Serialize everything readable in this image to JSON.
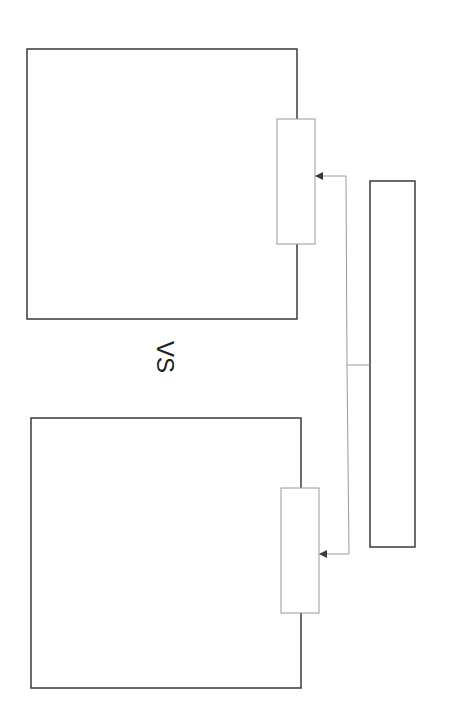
{
  "diagram": {
    "type": "wireframe-comparison",
    "separator_label": "VS",
    "colors": {
      "frame_stroke": "#3a3a3a",
      "panel_stroke": "#9a9a9a",
      "connector_stroke": "#9a9a9a",
      "arrowhead": "#3a3a3a",
      "background": "#ffffff"
    },
    "frames": [
      {
        "name": "top-frame",
        "x": 27,
        "y": 49,
        "w": 270,
        "h": 270,
        "panel": {
          "x": 277,
          "y": 119,
          "w": 38,
          "h": 125
        }
      },
      {
        "name": "bottom-frame",
        "x": 31,
        "y": 418,
        "w": 270,
        "h": 270,
        "panel": {
          "x": 281,
          "y": 488,
          "w": 38,
          "h": 125
        }
      }
    ],
    "source_bar": {
      "x": 370,
      "y": 181,
      "w": 45,
      "h": 366
    },
    "connectors": {
      "trunk_x": 347,
      "junction_y": 365,
      "targets_y": [
        176,
        554
      ]
    }
  }
}
